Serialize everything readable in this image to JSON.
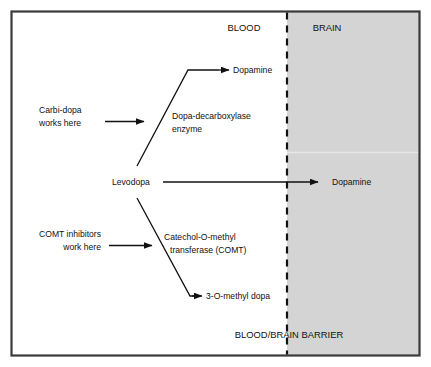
{
  "figure": {
    "border_color": "#3a3a3a",
    "background_color": "#ffffff",
    "brain_fill_color": "#d4d4d4",
    "line_color": "#111111"
  },
  "regions": {
    "blood_label": "BLOOD",
    "brain_label": "BRAIN",
    "barrier_caption": "BLOOD/BRAIN BARRIER"
  },
  "nodes": {
    "levodopa": "Levodopa",
    "dopamine_blood": "Dopamine",
    "dopamine_brain": "Dopamine",
    "methyl_dopa": "3-O-methyl dopa"
  },
  "enzymes": {
    "decarboxylase_line1": "Dopa-decarboxylase",
    "decarboxylase_line2": "enzyme",
    "comt_line1": "Catechol-O-methyl",
    "comt_line2": "transferase (COMT)"
  },
  "annotations": {
    "carbidopa_line1": "Carbi-dopa",
    "carbidopa_line2": "works here",
    "comt_inhibitors_line1": "COMT inhibitors",
    "comt_inhibitors_line2": "work here"
  }
}
